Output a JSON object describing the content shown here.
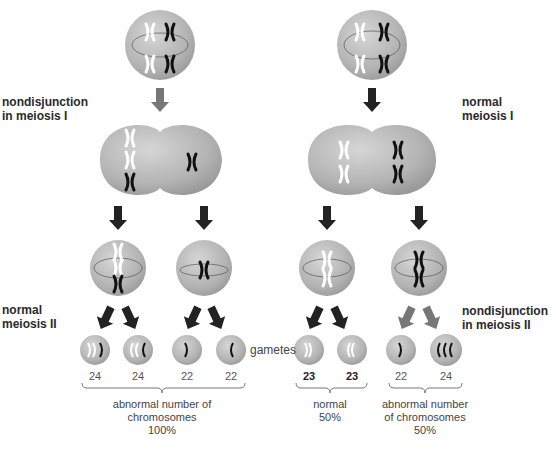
{
  "labels": {
    "nd1_a": "nondisjunction",
    "nd1_b": "in meiosis I",
    "n1_a": "normal",
    "n1_b": "meiosis I",
    "n2_a": "normal",
    "n2_b": "meiosis II",
    "nd2_a": "nondisjunction",
    "nd2_b": "in meiosis II",
    "gametes": "gametes"
  },
  "counts": [
    "24",
    "24",
    "22",
    "22",
    "23",
    "23",
    "22",
    "24"
  ],
  "summaries": {
    "left": [
      "abnormal number of",
      "chromosomes",
      "100%"
    ],
    "mid": [
      "normal",
      "50%"
    ],
    "right": [
      "abnormal number",
      "of chromosomes",
      "50%"
    ]
  },
  "colors": {
    "cell": "#b9b9b9",
    "arrow_dark": "#222222",
    "arrow_gray": "#777777"
  }
}
